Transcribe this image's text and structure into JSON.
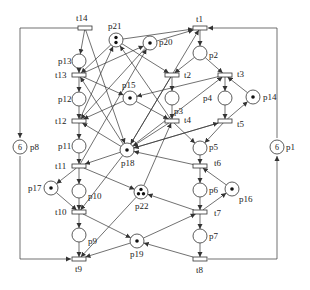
{
  "diagram": {
    "type": "petri-net",
    "places": [
      {
        "id": "p1",
        "label": "p1",
        "x": 277,
        "y": 147,
        "tokens": 6,
        "token_text": "6",
        "label_dx": 9,
        "label_dy": 3
      },
      {
        "id": "p2",
        "label": "p2",
        "x": 200,
        "y": 53,
        "tokens": 0,
        "label_dx": 9,
        "label_dy": 5
      },
      {
        "id": "p3",
        "label": "p3",
        "x": 172,
        "y": 98,
        "tokens": 0,
        "label_dx": 2,
        "label_dy": 16
      },
      {
        "id": "p4",
        "label": "p4",
        "x": 225,
        "y": 98,
        "tokens": 0,
        "label_dx": -22,
        "label_dy": 3
      },
      {
        "id": "p5",
        "label": "p5",
        "x": 200,
        "y": 148,
        "tokens": 0,
        "label_dx": 9,
        "label_dy": 2
      },
      {
        "id": "p6",
        "label": "p6",
        "x": 200,
        "y": 190,
        "tokens": 0,
        "label_dx": 9,
        "label_dy": 3
      },
      {
        "id": "p7",
        "label": "p7",
        "x": 200,
        "y": 236,
        "tokens": 0,
        "label_dx": 9,
        "label_dy": 3
      },
      {
        "id": "p8",
        "label": "p8",
        "x": 20,
        "y": 147,
        "tokens": 6,
        "token_text": "6",
        "label_dx": 10,
        "label_dy": 3
      },
      {
        "id": "p9",
        "label": "p9",
        "x": 79,
        "y": 235,
        "tokens": 0,
        "label_dx": 9,
        "label_dy": 9
      },
      {
        "id": "p10",
        "label": "p10",
        "x": 79,
        "y": 191,
        "tokens": 0,
        "label_dx": 9,
        "label_dy": 8
      },
      {
        "id": "p11",
        "label": "p11",
        "x": 79,
        "y": 146,
        "tokens": 0,
        "label_dx": -21,
        "label_dy": 3
      },
      {
        "id": "p12",
        "label": "p12",
        "x": 79,
        "y": 99,
        "tokens": 0,
        "label_dx": -21,
        "label_dy": 3
      },
      {
        "id": "p13",
        "label": "p13",
        "x": 79,
        "y": 61,
        "tokens": 0,
        "label_dx": -21,
        "label_dy": 3
      },
      {
        "id": "p14",
        "label": "p14",
        "x": 253,
        "y": 97,
        "tokens": 1,
        "label_dx": 10,
        "label_dy": 3
      },
      {
        "id": "p15",
        "label": "p15",
        "x": 130,
        "y": 98,
        "tokens": 1,
        "label_dx": -8,
        "label_dy": -10
      },
      {
        "id": "p16",
        "label": "p16",
        "x": 232,
        "y": 189,
        "tokens": 1,
        "label_dx": 7,
        "label_dy": 13
      },
      {
        "id": "p17",
        "label": "p17",
        "x": 51,
        "y": 188,
        "tokens": 1,
        "label_dx": -23,
        "label_dy": 3
      },
      {
        "id": "p18",
        "label": "p18",
        "x": 127,
        "y": 150,
        "tokens": 1,
        "label_dx": -6,
        "label_dy": 16
      },
      {
        "id": "p19",
        "label": "p19",
        "x": 137,
        "y": 241,
        "tokens": 1,
        "label_dx": -7,
        "label_dy": 16
      },
      {
        "id": "p20",
        "label": "p20",
        "x": 150,
        "y": 43,
        "tokens": 1,
        "label_dx": 9,
        "label_dy": 2
      },
      {
        "id": "p21",
        "label": "p21",
        "x": 116,
        "y": 40,
        "tokens": 2,
        "label_dx": -8,
        "label_dy": -11
      },
      {
        "id": "p22",
        "label": "p22",
        "x": 141,
        "y": 192,
        "tokens": 3,
        "label_dx": -6,
        "label_dy": 17
      }
    ],
    "transitions": [
      {
        "id": "t1",
        "label": "t1",
        "x": 200,
        "y": 28,
        "label_dx": -4,
        "label_dy": -6
      },
      {
        "id": "t2",
        "label": "t2",
        "x": 172,
        "y": 75,
        "label_dx": 12,
        "label_dy": 3
      },
      {
        "id": "t3",
        "label": "t3",
        "x": 225,
        "y": 75,
        "label_dx": 12,
        "label_dy": 2
      },
      {
        "id": "t4",
        "label": "t4",
        "x": 172,
        "y": 121,
        "label_dx": 12,
        "label_dy": 2
      },
      {
        "id": "t5",
        "label": "t5",
        "x": 225,
        "y": 121,
        "label_dx": 12,
        "label_dy": 6
      },
      {
        "id": "t6",
        "label": "t6",
        "x": 200,
        "y": 166,
        "label_dx": 14,
        "label_dy": 0
      },
      {
        "id": "t7",
        "label": "t7",
        "x": 200,
        "y": 212,
        "label_dx": 14,
        "label_dy": 4
      },
      {
        "id": "t8",
        "label": "t8",
        "x": 200,
        "y": 259,
        "label_dx": -4,
        "label_dy": 14
      },
      {
        "id": "t9",
        "label": "t9",
        "x": 79,
        "y": 259,
        "label_dx": -4,
        "label_dy": 13
      },
      {
        "id": "t10",
        "label": "t10",
        "x": 79,
        "y": 212,
        "label_dx": -24,
        "label_dy": 3
      },
      {
        "id": "t11",
        "label": "t11",
        "x": 79,
        "y": 166,
        "label_dx": -24,
        "label_dy": 3
      },
      {
        "id": "t12",
        "label": "t12",
        "x": 79,
        "y": 121,
        "label_dx": -24,
        "label_dy": 3
      },
      {
        "id": "t13",
        "label": "t13",
        "x": 79,
        "y": 75,
        "label_dx": -24,
        "label_dy": 3
      },
      {
        "id": "t14",
        "label": "t14",
        "x": 85,
        "y": 28,
        "label_dx": -9,
        "label_dy": -7
      }
    ],
    "arcs": [
      [
        "t1",
        "p2"
      ],
      [
        "p2",
        "t2"
      ],
      [
        "p2",
        "t3"
      ],
      [
        "t2",
        "p3"
      ],
      [
        "p3",
        "t4"
      ],
      [
        "t3",
        "p4"
      ],
      [
        "p4",
        "t5"
      ],
      [
        "p14",
        "t3"
      ],
      [
        "t5",
        "p14"
      ],
      [
        "t4",
        "p5"
      ],
      [
        "t5",
        "p5"
      ],
      [
        "p5",
        "t6"
      ],
      [
        "t6",
        "p6"
      ],
      [
        "p6",
        "t7"
      ],
      [
        "t7",
        "p7"
      ],
      [
        "p7",
        "t8"
      ],
      [
        "p16",
        "t6"
      ],
      [
        "t7",
        "p16"
      ],
      [
        "t14",
        "p13"
      ],
      [
        "p13",
        "t13"
      ],
      [
        "t13",
        "p12"
      ],
      [
        "p12",
        "t12"
      ],
      [
        "t12",
        "p11"
      ],
      [
        "p11",
        "t11"
      ],
      [
        "t11",
        "p10"
      ],
      [
        "p10",
        "t10"
      ],
      [
        "t10",
        "p9"
      ],
      [
        "p9",
        "t9"
      ],
      [
        "p17",
        "t10"
      ],
      [
        "t11",
        "p17"
      ],
      [
        "p21",
        "t1"
      ],
      [
        "p20",
        "t1"
      ],
      [
        "p21",
        "t13"
      ],
      [
        "p21",
        "t2"
      ],
      [
        "p20",
        "t12"
      ],
      [
        "t13",
        "p20"
      ],
      [
        "t14",
        "p18"
      ],
      [
        "t13",
        "p15"
      ],
      [
        "p15",
        "t12"
      ],
      [
        "p15",
        "t4"
      ],
      [
        "t3",
        "p15"
      ],
      [
        "p18",
        "t13"
      ],
      [
        "p18",
        "t12"
      ],
      [
        "p18",
        "t11"
      ],
      [
        "t2",
        "p18"
      ],
      [
        "t4",
        "p18"
      ],
      [
        "t5",
        "p18"
      ],
      [
        "t6",
        "p18"
      ],
      [
        "p18",
        "t3"
      ],
      [
        "p18",
        "t5"
      ],
      [
        "p18",
        "t1"
      ],
      [
        "t12",
        "p21"
      ],
      [
        "t4",
        "p21"
      ],
      [
        "t11",
        "p22"
      ],
      [
        "p22",
        "t9"
      ],
      [
        "p22",
        "t4"
      ],
      [
        "t7",
        "p22"
      ],
      [
        "t10",
        "p19"
      ],
      [
        "p19",
        "t9"
      ],
      [
        "p19",
        "t7"
      ],
      [
        "t8",
        "p19"
      ],
      [
        "p18",
        "t10"
      ],
      [
        "t11",
        "p20"
      ]
    ],
    "border_arcs": [
      {
        "from": "t14",
        "to": "p8",
        "path": [
          [
            85,
            28
          ],
          [
            20,
            28
          ],
          [
            20,
            138
          ]
        ]
      },
      {
        "from": "p8",
        "to": "t9",
        "path": [
          [
            20,
            156
          ],
          [
            20,
            259
          ],
          [
            71,
            259
          ]
        ]
      },
      {
        "from": "t8",
        "to": "p1",
        "path": [
          [
            208,
            259
          ],
          [
            277,
            259
          ],
          [
            277,
            156
          ]
        ]
      },
      {
        "from": "p1",
        "to": "t1",
        "path": [
          [
            277,
            138
          ],
          [
            277,
            28
          ],
          [
            208,
            28
          ]
        ]
      }
    ],
    "colors": {
      "stroke": "#333333",
      "token": "#111111",
      "background": "#ffffff"
    }
  }
}
